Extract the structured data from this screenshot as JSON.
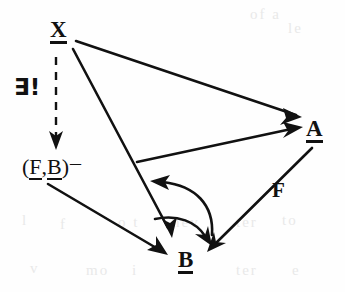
{
  "diagram": {
    "kind": "commutative-diagram",
    "background_color": "#fefefe",
    "ink_color": "#111111",
    "nodes": [
      {
        "id": "x",
        "label": "X",
        "underlined": true,
        "x": 50,
        "y": 18
      },
      {
        "id": "fb",
        "label": "(F,B)-",
        "underlined": true,
        "x": 22,
        "y": 152
      },
      {
        "id": "a",
        "label": "A",
        "underlined": true,
        "x": 306,
        "y": 117
      },
      {
        "id": "b",
        "label": "B",
        "underlined": true,
        "x": 178,
        "y": 248
      }
    ],
    "edge_labels": [
      {
        "id": "exists",
        "text": "∃!",
        "x": 14,
        "y": 76,
        "for_edge": "x-to-fb"
      },
      {
        "id": "f",
        "text": "F",
        "x": 272,
        "y": 180,
        "for_edge": "a-to-b"
      }
    ],
    "node_text": {
      "x": "X",
      "a": "A",
      "b": "B",
      "fb_open": "(",
      "fb_f": "F",
      "fb_comma": ",",
      "fb_b": "B",
      "fb_close": ")",
      "fb_minus": "–"
    },
    "label_text": {
      "exists_unique": "∃!",
      "functor_f": "F"
    },
    "edges": [
      {
        "id": "x-to-a",
        "from": "x",
        "to": "a",
        "style": "solid",
        "arrowhead": true
      },
      {
        "id": "x-to-b",
        "from": "x",
        "to": "b",
        "style": "solid",
        "arrowhead": true
      },
      {
        "id": "x-to-fb",
        "from": "x",
        "to": "fb",
        "style": "dashed",
        "arrowhead": true
      },
      {
        "id": "fb-to-a",
        "from": "fb",
        "to": "a",
        "style": "solid",
        "arrowhead": true
      },
      {
        "id": "fb-to-b",
        "from": "fb",
        "to": "b",
        "style": "solid",
        "arrowhead": true
      },
      {
        "id": "a-to-b",
        "from": "a",
        "to": "b",
        "style": "solid",
        "arrowhead": true
      },
      {
        "id": "curve-upper",
        "from": "b",
        "to": "mid-left",
        "style": "curved",
        "arrowhead": true
      },
      {
        "id": "curve-lower",
        "from": "mid-left",
        "to": "b",
        "style": "curved",
        "arrowhead": true
      }
    ]
  },
  "ghosts": [
    {
      "text": "of a",
      "x": 250,
      "y": 6
    },
    {
      "text": "le",
      "x": 288,
      "y": 20
    },
    {
      "text": "o t",
      "x": 118,
      "y": 214
    },
    {
      "text": "l",
      "x": 22,
      "y": 212
    },
    {
      "text": "f",
      "x": 60,
      "y": 216
    },
    {
      "text": "nev",
      "x": 172,
      "y": 214
    },
    {
      "text": "ter",
      "x": 236,
      "y": 214
    },
    {
      "text": "to",
      "x": 282,
      "y": 212
    },
    {
      "text": "v",
      "x": 30,
      "y": 260
    },
    {
      "text": "mo",
      "x": 86,
      "y": 262
    },
    {
      "text": "i",
      "x": 132,
      "y": 262
    },
    {
      "text": "ter",
      "x": 236,
      "y": 262
    },
    {
      "text": "e",
      "x": 292,
      "y": 262
    }
  ]
}
